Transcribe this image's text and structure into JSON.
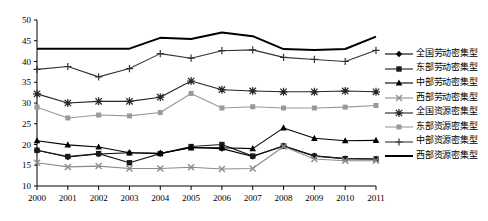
{
  "chart_data": {
    "type": "line",
    "title": "",
    "xlabel": "",
    "ylabel": "",
    "grid": false,
    "legend_position": "right",
    "categories": [
      "2000",
      "2001",
      "2002",
      "2003",
      "2004",
      "2005",
      "2006",
      "2007",
      "2008",
      "2009",
      "2010",
      "2011"
    ],
    "x": [
      2000,
      2001,
      2002,
      2003,
      2004,
      2005,
      2006,
      2007,
      2008,
      2009,
      2010,
      2011
    ],
    "xlim": [
      2000,
      2011
    ],
    "ylim": [
      10,
      50
    ],
    "yticks": [
      10,
      15,
      20,
      25,
      30,
      35,
      40,
      45,
      50
    ],
    "series": [
      {
        "name": "全国劳动密集型",
        "marker": "diamond",
        "color": "#000000",
        "values": [
          18.6,
          17.0,
          17.7,
          18.0,
          17.8,
          19.3,
          19.0,
          17.1,
          19.7,
          17.3,
          16.6,
          16.5
        ]
      },
      {
        "name": "东部劳动密集型",
        "marker": "square",
        "color": "#1a1a1a",
        "values": [
          18.6,
          17.1,
          17.8,
          15.6,
          17.8,
          19.5,
          20.0,
          17.2,
          19.6,
          17.2,
          16.6,
          16.5
        ]
      },
      {
        "name": "中部劳动密集型",
        "marker": "triangle",
        "color": "#000000",
        "values": [
          20.9,
          19.9,
          19.4,
          18.0,
          17.9,
          19.2,
          19.2,
          19.0,
          24.0,
          21.5,
          20.9,
          21.0
        ]
      },
      {
        "name": "西部劳动密集型",
        "marker": "x",
        "color": "#8c8c8c",
        "values": [
          15.6,
          14.6,
          14.8,
          14.2,
          14.2,
          14.5,
          14.1,
          14.2,
          19.5,
          16.5,
          16.1,
          16.1
        ]
      },
      {
        "name": "全国资源密集型",
        "marker": "star",
        "color": "#262626",
        "values": [
          32.2,
          30.0,
          30.4,
          30.4,
          31.4,
          35.3,
          33.2,
          32.9,
          32.7,
          32.7,
          32.9,
          32.7
        ]
      },
      {
        "name": "东部资源密集型",
        "marker": "gray-square",
        "color": "#999999",
        "values": [
          29.0,
          26.4,
          27.1,
          26.9,
          27.7,
          32.3,
          28.8,
          29.1,
          28.8,
          28.8,
          29.0,
          29.4
        ]
      },
      {
        "name": "中部资源密集型",
        "marker": "plus",
        "color": "#333333",
        "values": [
          38.1,
          38.8,
          36.3,
          38.3,
          41.9,
          40.8,
          42.6,
          42.8,
          41.0,
          40.5,
          40.0,
          42.7
        ]
      },
      {
        "name": "西部资源密集型",
        "marker": "line",
        "color": "#000000",
        "values": [
          43.1,
          43.1,
          43.1,
          43.1,
          45.7,
          45.4,
          47.0,
          46.1,
          43.0,
          42.8,
          43.0,
          46.0
        ]
      }
    ]
  },
  "legend": {
    "items": [
      {
        "label": "全国劳动密集型"
      },
      {
        "label": "东部劳动密集型"
      },
      {
        "label": "中部劳动密集型"
      },
      {
        "label": "西部劳动密集型"
      },
      {
        "label": "全国资源密集型"
      },
      {
        "label": "东部资源密集型"
      },
      {
        "label": "中部资源密集型"
      },
      {
        "label": "西部资源密集型"
      }
    ]
  }
}
